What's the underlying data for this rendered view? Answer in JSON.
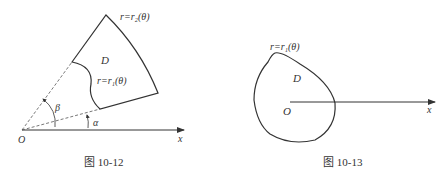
{
  "figures": [
    {
      "caption": "图 10-12",
      "labels": {
        "outer_curve": "r=r₂(θ)",
        "inner_curve": "r=r₁(θ)",
        "region": "D",
        "angle_beta": "β",
        "angle_alpha": "α",
        "origin": "O",
        "x_axis": "x"
      }
    },
    {
      "caption": "图 10-13",
      "labels": {
        "curve": "r=r₁(θ)",
        "region": "D",
        "origin": "O",
        "x_axis": "x"
      }
    }
  ],
  "colors": {
    "stroke": "#333333",
    "background": "#ffffff"
  }
}
